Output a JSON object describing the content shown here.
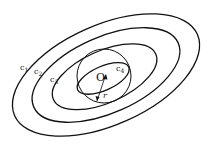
{
  "diagram": {
    "type": "concentric-ellipses-with-circle",
    "center_label": "O",
    "radius_label": "r",
    "ellipses": [
      {
        "id": "c1",
        "label": "c",
        "subscript": "1"
      },
      {
        "id": "c2",
        "label": "c",
        "subscript": "2"
      },
      {
        "id": "c3",
        "label": "c",
        "subscript": "3"
      },
      {
        "id": "c4",
        "label": "c",
        "subscript": "4"
      }
    ],
    "colors": {
      "stroke": "#111111",
      "background": "#ffffff"
    }
  }
}
